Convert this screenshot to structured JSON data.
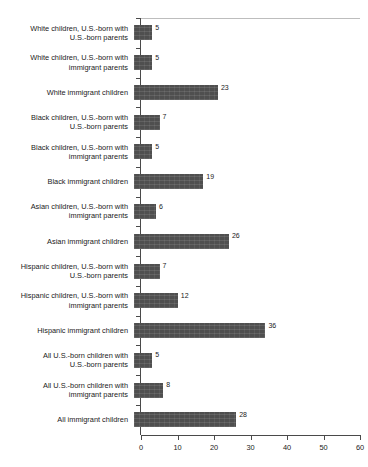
{
  "chart_data": {
    "type": "bar",
    "orientation": "horizontal",
    "title": "",
    "subtitle": "",
    "xlabel": "",
    "ylabel": "",
    "xlim": [
      0,
      60
    ],
    "xticks": [
      0,
      10,
      20,
      30,
      40,
      50,
      60
    ],
    "xtick_labels": [
      "0",
      "10",
      "20",
      "30",
      "40",
      "50",
      "60"
    ],
    "grid": false,
    "legend": false,
    "bar_color": "#4f4f4f",
    "axis_color": "#4a4a4a",
    "categories": [
      "White children, U.S.-born with\nU.S.-born parents",
      "White children, U.S.-born with\nimmigrant parents",
      "White immigrant children",
      "Black children, U.S.-born with\nU.S.-born parents",
      "Black children, U.S.-born with\nimmigrant parents",
      "Black immigrant children",
      "Asian children, U.S.-born with\nimmigrant parents",
      "Asian immigrant children",
      "Hispanic children, U.S.-born with\nU.S.-born parents",
      "Hispanic children, U.S.-born with\nimmigrant parents",
      "Hispanic immigrant children",
      "All U.S.-born children with\nU.S.-born parents",
      "All U.S.-born children with\nimmigrant parents",
      "All immigrant children"
    ],
    "values": [
      5,
      5,
      23,
      7,
      5,
      19,
      6,
      26,
      7,
      12,
      36,
      5,
      8,
      28
    ],
    "value_labels": [
      "5",
      "5",
      "23",
      "7",
      "5",
      "19",
      "6",
      "26",
      "7",
      "12",
      "36",
      "5",
      "8",
      "28"
    ]
  }
}
